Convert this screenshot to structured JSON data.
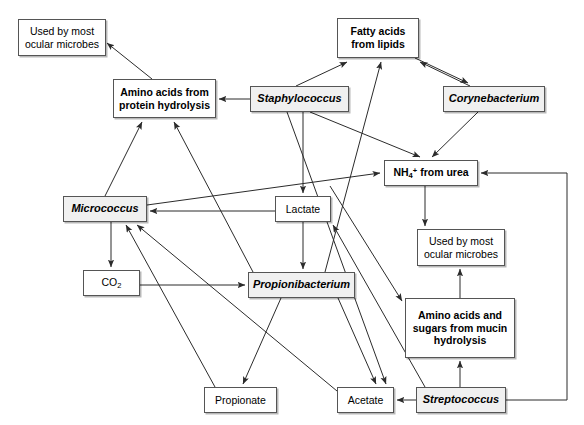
{
  "diagram": {
    "type": "flow-network",
    "background_color": "#ffffff",
    "edge_color": "#2b2b2b",
    "organism_fill": "#f0f0f0",
    "metabolite_fill": "#ffffff",
    "nodes": [
      {
        "id": "used_by_most_left",
        "label": "Used by most ocular microbes",
        "line1": "Used by most",
        "line2": "ocular microbes",
        "kind": "fate",
        "x": 18,
        "y": 19,
        "w": 88,
        "h": 37
      },
      {
        "id": "amino_protein",
        "label": "Amino acids from protein hydrolysis",
        "line1": "Amino acids from",
        "line2": "protein hydrolysis",
        "kind": "pool",
        "x": 113,
        "y": 79,
        "w": 103,
        "h": 39
      },
      {
        "id": "fatty_acids",
        "label": "Fatty acids from lipids",
        "line1": "Fatty acids",
        "line2": "from lipids",
        "kind": "pool",
        "x": 337,
        "y": 18,
        "w": 82,
        "h": 40
      },
      {
        "id": "staphylococcus",
        "label": "Staphylococcus",
        "kind": "organism",
        "x": 250,
        "y": 86,
        "w": 99,
        "h": 26
      },
      {
        "id": "corynebacterium",
        "label": "Corynebacterium",
        "kind": "organism",
        "x": 443,
        "y": 86,
        "w": 102,
        "h": 26
      },
      {
        "id": "nh4_urea",
        "label": "NH4+ from urea",
        "kind": "pool",
        "x": 384,
        "y": 160,
        "w": 94,
        "h": 26
      },
      {
        "id": "micrococcus",
        "label": "Micrococcus",
        "kind": "organism",
        "x": 63,
        "y": 196,
        "w": 84,
        "h": 26
      },
      {
        "id": "lactate",
        "label": "Lactate",
        "kind": "metabolite",
        "x": 275,
        "y": 196,
        "w": 56,
        "h": 26
      },
      {
        "id": "used_by_most_right",
        "label": "Used by most ocular microbes",
        "line1": "Used by most",
        "line2": "ocular microbes",
        "kind": "fate",
        "x": 417,
        "y": 229,
        "w": 88,
        "h": 37
      },
      {
        "id": "co2",
        "label": "CO2",
        "kind": "metabolite",
        "x": 83,
        "y": 270,
        "w": 57,
        "h": 26
      },
      {
        "id": "propionibacterium",
        "label": "Propionibacterium",
        "kind": "organism",
        "x": 248,
        "y": 272,
        "w": 107,
        "h": 26
      },
      {
        "id": "amino_mucin",
        "label": "Amino acids and sugars from mucin hydrolysis",
        "line1": "Amino acids and",
        "line2": "sugars from mucin",
        "line3": "hydrolysis",
        "kind": "pool",
        "x": 405,
        "y": 298,
        "w": 110,
        "h": 60
      },
      {
        "id": "propionate",
        "label": "Propionate",
        "kind": "metabolite",
        "x": 204,
        "y": 387,
        "w": 73,
        "h": 26
      },
      {
        "id": "acetate",
        "label": "Acetate",
        "kind": "metabolite",
        "x": 337,
        "y": 387,
        "w": 57,
        "h": 26
      },
      {
        "id": "streptococcus",
        "label": "Streptococcus",
        "kind": "organism",
        "x": 416,
        "y": 387,
        "w": 90,
        "h": 26
      }
    ],
    "edges": [
      {
        "from": "amino_protein",
        "to": "used_by_most_left"
      },
      {
        "from": "staphylococcus",
        "to": "amino_protein"
      },
      {
        "from": "micrococcus",
        "to": "amino_protein"
      },
      {
        "from": "propionibacterium",
        "to": "amino_protein"
      },
      {
        "from": "staphylococcus",
        "to": "fatty_acids"
      },
      {
        "from": "corynebacterium",
        "to": "fatty_acids"
      },
      {
        "from": "fatty_acids",
        "to": "corynebacterium"
      },
      {
        "from": "propionibacterium",
        "to": "fatty_acids"
      },
      {
        "from": "staphylococcus",
        "to": "nh4_urea"
      },
      {
        "from": "corynebacterium",
        "to": "nh4_urea"
      },
      {
        "from": "micrococcus",
        "to": "nh4_urea"
      },
      {
        "from": "streptococcus",
        "to": "nh4_urea"
      },
      {
        "from": "nh4_urea",
        "to": "used_by_most_right"
      },
      {
        "from": "staphylococcus",
        "to": "lactate"
      },
      {
        "from": "lactate",
        "to": "micrococcus"
      },
      {
        "from": "lactate",
        "to": "propionibacterium"
      },
      {
        "from": "micrococcus",
        "to": "co2"
      },
      {
        "from": "co2",
        "to": "propionibacterium"
      },
      {
        "from": "propionibacterium",
        "to": "propionate"
      },
      {
        "from": "propionibacterium",
        "to": "acetate"
      },
      {
        "from": "propionate",
        "to": "micrococcus"
      },
      {
        "from": "acetate",
        "to": "micrococcus"
      },
      {
        "from": "streptococcus",
        "to": "acetate"
      },
      {
        "from": "streptococcus",
        "to": "amino_mucin"
      },
      {
        "from": "amino_mucin",
        "to": "used_by_most_right"
      },
      {
        "from": "streptococcus",
        "to": "lactate"
      }
    ]
  }
}
